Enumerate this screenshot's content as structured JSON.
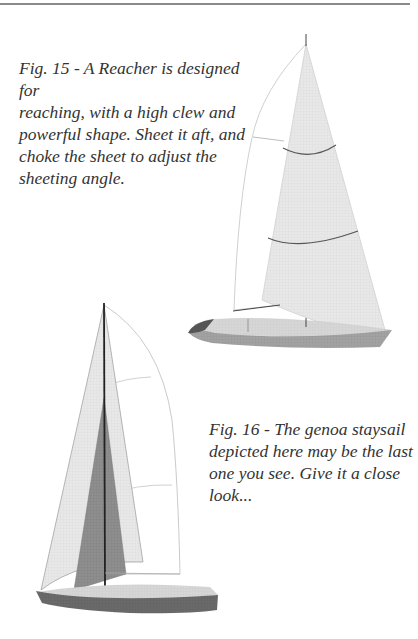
{
  "page": {
    "figures": [
      {
        "id": "fig15",
        "caption": "Fig. 15 - A Reacher is designed for reaching, with a high clew and powerful shape. Sheet it aft, and choke the sheet to adjust the sheeting angle.",
        "caption_lines": [
          "Fig. 15 - A Reacher is designed for",
          "reaching, with a high clew and",
          "powerful shape. Sheet it aft, and",
          "choke the sheet to adjust the",
          "sheeting angle."
        ],
        "illustration": "sailboat-with-reacher-sail"
      },
      {
        "id": "fig16",
        "caption": "Fig. 16 - The genoa staysail depicted here may be the last one you see. Give it a close look...",
        "caption_lines": [
          "Fig. 16 - The genoa staysail",
          "depicted here may be the last",
          "one you see. Give it a close",
          "look..."
        ],
        "illustration": "sailboat-with-genoa-staysail"
      }
    ],
    "colors": {
      "sail_light": "#e6e6e6",
      "sail_dark": "#8c8c8c",
      "hull_dark": "#6b6b6b",
      "deck": "#d4d4d4",
      "outline": "#bdbdbd",
      "mast": "#333333",
      "rule": "#8a8a8a",
      "text": "#333333"
    }
  }
}
